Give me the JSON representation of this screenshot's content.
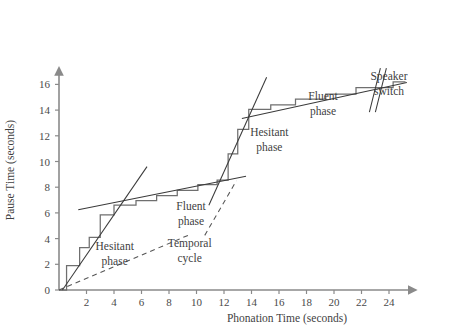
{
  "chart_data": {
    "type": "line",
    "title": "",
    "xlabel": "Phonation Time (seconds)",
    "ylabel": "Pause Time (seconds)",
    "xlim": [
      0,
      25.5
    ],
    "ylim": [
      0,
      16.8
    ],
    "xticks": [
      2,
      4,
      6,
      8,
      10,
      12,
      14,
      16,
      18,
      20,
      22,
      24
    ],
    "yticks": [
      0,
      2,
      4,
      6,
      8,
      10,
      12,
      14,
      16
    ],
    "xtick_labels": [
      "2",
      "4",
      "6",
      "8",
      "10",
      "12",
      "14",
      "16",
      "18",
      "20",
      "22",
      "24"
    ],
    "ytick_labels": [
      "0",
      "2",
      "4",
      "6",
      "8",
      "10",
      "12",
      "14",
      "16"
    ],
    "grid": false,
    "legend": null,
    "series": [
      {
        "name": "Cumulative pause vs phonation staircase",
        "style": "step",
        "color": "#6f6f6f",
        "points": [
          [
            0.0,
            0.0
          ],
          [
            0.55,
            0.0
          ],
          [
            0.55,
            1.9
          ],
          [
            1.5,
            1.9
          ],
          [
            1.5,
            3.3
          ],
          [
            2.2,
            3.3
          ],
          [
            2.2,
            4.1
          ],
          [
            3.0,
            4.1
          ],
          [
            3.0,
            5.85
          ],
          [
            4.0,
            5.85
          ],
          [
            4.0,
            6.6
          ],
          [
            5.6,
            6.6
          ],
          [
            5.6,
            6.95
          ],
          [
            7.1,
            6.95
          ],
          [
            7.1,
            7.35
          ],
          [
            8.6,
            7.35
          ],
          [
            8.6,
            7.75
          ],
          [
            10.1,
            7.75
          ],
          [
            10.1,
            8.2
          ],
          [
            11.5,
            8.2
          ],
          [
            11.5,
            8.55
          ],
          [
            12.3,
            8.55
          ],
          [
            12.3,
            10.6
          ],
          [
            13.0,
            10.6
          ],
          [
            13.0,
            12.5
          ],
          [
            13.8,
            12.5
          ],
          [
            13.8,
            14.05
          ],
          [
            15.4,
            14.05
          ],
          [
            15.4,
            14.4
          ],
          [
            17.2,
            14.4
          ],
          [
            17.2,
            14.85
          ],
          [
            19.4,
            14.85
          ],
          [
            19.4,
            15.25
          ],
          [
            21.6,
            15.25
          ],
          [
            21.6,
            15.75
          ],
          [
            24.3,
            15.75
          ],
          [
            24.3,
            16.2
          ],
          [
            25.2,
            16.2
          ]
        ]
      },
      {
        "name": "Hesitant phase regression (first)",
        "style": "solid-fit",
        "color": "#3a3a3a",
        "x0": 0.25,
        "y0": 0.0,
        "x1": 6.4,
        "y1": 9.6
      },
      {
        "name": "Fluent phase regression (first)",
        "style": "solid-fit",
        "color": "#3a3a3a",
        "x0": 1.4,
        "y0": 6.25,
        "x1": 13.6,
        "y1": 8.85
      },
      {
        "name": "Hesitant phase regression (second)",
        "style": "solid-fit",
        "color": "#3a3a3a",
        "x0": 10.9,
        "y0": 6.6,
        "x1": 15.1,
        "y1": 16.55
      },
      {
        "name": "Fluent phase regression (second)",
        "style": "solid-fit",
        "color": "#3a3a3a",
        "x0": 13.3,
        "y0": 13.35,
        "x1": 25.3,
        "y1": 16.15
      },
      {
        "name": "Temporal cycle baseline",
        "style": "dashed",
        "color": "#555555",
        "x0": 0.0,
        "y0": 0.0,
        "x1": 9.6,
        "y1": 4.35
      },
      {
        "name": "Temporal cycle pointer",
        "style": "dashed",
        "color": "#555555",
        "x0": 10.6,
        "y0": 4.25,
        "x1": 12.9,
        "y1": 8.5
      }
    ],
    "annotations": [
      {
        "id": "hesitant-phase-1",
        "text_line1": "Hesitant",
        "text_line2": "phase",
        "x": 4.05,
        "y": 3.15
      },
      {
        "id": "fluent-phase-1",
        "text_line1": "Fluent",
        "text_line2": "phase",
        "x": 9.6,
        "y": 6.25
      },
      {
        "id": "hesitant-phase-2",
        "text_line1": "Hesitant",
        "text_line2": "phase",
        "x": 15.3,
        "y": 11.95
      },
      {
        "id": "fluent-phase-2",
        "text_line1": "Fluent",
        "text_line2": "phase",
        "x": 19.2,
        "y": 14.75
      },
      {
        "id": "temporal-cycle",
        "text_line1": "Temporal",
        "text_line2": "cycle",
        "x": 9.5,
        "y": 3.35
      },
      {
        "id": "speaker-switch",
        "text_line1": "Speaker",
        "text_line2": "switch",
        "x": 24.0,
        "y": 16.35
      }
    ],
    "speaker_switch_marks": {
      "description": "double slash break marks crossing the upper fluent line",
      "x": 22.9,
      "y": 15.55
    }
  },
  "axes": {
    "x_axis_name": "x-axis-arrow",
    "y_axis_name": "y-axis-arrow",
    "color": "#8a8a8a"
  }
}
